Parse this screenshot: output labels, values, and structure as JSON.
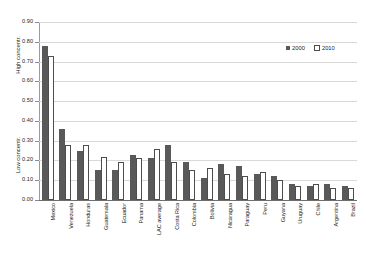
{
  "chart_data": {
    "type": "bar",
    "title": "",
    "xlabel": "",
    "ylabel": "High concentr. / Low concentr.",
    "ylim": [
      0.0,
      0.9
    ],
    "ytick_labels": [
      "0.90",
      "0.80",
      "0.70",
      "0.60",
      "0.50",
      "0.40",
      "0.30",
      "0.20",
      "0.10",
      "0.00"
    ],
    "ytick_values": [
      0.9,
      0.8,
      0.7,
      0.6,
      0.5,
      0.4,
      0.3,
      0.2,
      0.1,
      0.0
    ],
    "grid": true,
    "legend_position": "top-right",
    "axis_titles": {
      "high": "High concentr.",
      "low": "Low concentr."
    },
    "categories": [
      "Mexico",
      "Venezuela",
      "Honduras",
      "Guatemala",
      "Ecuador",
      "Panama",
      "LAC average",
      "Costa Rica",
      "Colombia",
      "Bolivia",
      "Nicaragua",
      "Paraguay",
      "Peru",
      "Guyana",
      "Uruguay",
      "Chile",
      "Argentina",
      "Brazil"
    ],
    "series": [
      {
        "name": "2000",
        "color": "#595959",
        "values": [
          0.78,
          0.36,
          0.25,
          0.15,
          0.15,
          0.23,
          0.21,
          0.28,
          0.19,
          0.11,
          0.18,
          0.17,
          0.13,
          0.12,
          0.08,
          0.07,
          0.08,
          0.07
        ]
      },
      {
        "name": "2010",
        "color": "#ffffff",
        "values": [
          0.73,
          0.28,
          0.28,
          0.22,
          0.19,
          0.21,
          0.26,
          0.19,
          0.15,
          0.16,
          0.13,
          0.12,
          0.14,
          0.1,
          0.07,
          0.08,
          0.06,
          0.06
        ]
      }
    ]
  },
  "legend": {
    "items": [
      {
        "label": "2000"
      },
      {
        "label": "2010"
      }
    ]
  }
}
